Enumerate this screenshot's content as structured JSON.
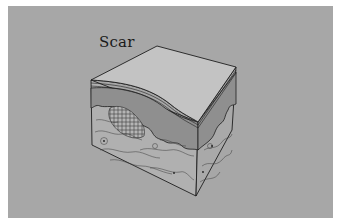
{
  "figure": {
    "label": "Scar",
    "colors": {
      "background": "#a7a7a7",
      "border": "#ffffff",
      "top_face": "#c3c3c3",
      "epidermis_bands": "#b8b8b8",
      "dermis_upper": "#8f8f8f",
      "dermis_lower": "#b0b0b0",
      "scar_tissue": "#9a9a9a",
      "ink": "#1e1e1e"
    },
    "layers": [
      "epidermis",
      "dermis-papillary",
      "scar-tissue",
      "dermis-reticular"
    ]
  }
}
